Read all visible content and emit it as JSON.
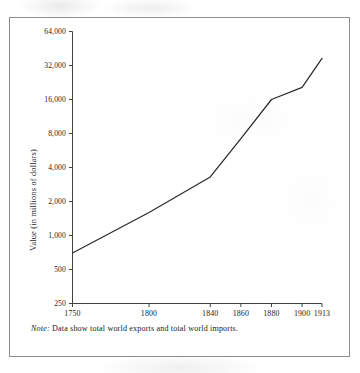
{
  "figure": {
    "note_label": "Note:",
    "note_text": " Data show total world exports and total world imports."
  },
  "chart_data": {
    "type": "line",
    "title": "",
    "xlabel": "",
    "ylabel": "Value (in millions of dollars)",
    "yscale": "log",
    "ylim": [
      250,
      64000
    ],
    "xlim": [
      1750,
      1913
    ],
    "grid": false,
    "legend": false,
    "ytick_labels": [
      "64,000",
      "32,000",
      "16,000",
      "8,000",
      "4,000",
      "2,000",
      "1,000",
      "500",
      "250"
    ],
    "ytick_values": [
      64000,
      32000,
      16000,
      8000,
      4000,
      2000,
      1000,
      500,
      250
    ],
    "xtick_labels": [
      "1750",
      "1800",
      "1840",
      "1860",
      "1880",
      "1900",
      "1913"
    ],
    "xtick_values": [
      1750,
      1800,
      1840,
      1860,
      1880,
      1900,
      1913
    ],
    "x": [
      1750,
      1800,
      1840,
      1860,
      1880,
      1900,
      1913
    ],
    "values": [
      700,
      1600,
      3300,
      7200,
      16000,
      20500,
      37000
    ],
    "series": [
      {
        "name": "World trade",
        "x": [
          1750,
          1800,
          1840,
          1860,
          1880,
          1900,
          1913
        ],
        "values": [
          700,
          1600,
          3300,
          7200,
          16000,
          20500,
          37000
        ],
        "color": "#2b2b2b"
      }
    ]
  }
}
